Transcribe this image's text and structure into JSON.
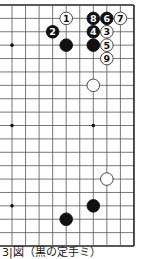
{
  "diagram": {
    "type": "go-board-partial",
    "grid": {
      "columns": 10,
      "rows": 19,
      "x0": 12,
      "dx": 13.55,
      "y0": 5,
      "dy": 13.39,
      "edges": {
        "top": true,
        "right": true,
        "bottom": true,
        "left": false
      },
      "line_color": "#555555",
      "edge_color": "#222222"
    },
    "star_points": [
      {
        "col": 0,
        "row": 3
      },
      {
        "col": 0,
        "row": 9
      },
      {
        "col": 0,
        "row": 15
      },
      {
        "col": 6,
        "row": 3
      },
      {
        "col": 6,
        "row": 9
      },
      {
        "col": 6,
        "row": 15
      }
    ],
    "stones": [
      {
        "color": "white",
        "col": 4,
        "row": 1,
        "label": "1"
      },
      {
        "color": "black",
        "col": 3,
        "row": 2,
        "label": "2"
      },
      {
        "color": "white",
        "col": 7,
        "row": 2,
        "label": "3"
      },
      {
        "color": "black",
        "col": 6,
        "row": 2,
        "label": "4"
      },
      {
        "color": "white",
        "col": 7,
        "row": 3,
        "label": "5"
      },
      {
        "color": "black",
        "col": 7,
        "row": 1,
        "label": "6"
      },
      {
        "color": "white",
        "col": 8,
        "row": 1,
        "label": "7"
      },
      {
        "color": "black",
        "col": 6,
        "row": 1,
        "label": "8"
      },
      {
        "color": "white",
        "col": 7,
        "row": 4,
        "label": "9"
      },
      {
        "color": "black",
        "col": 4,
        "row": 3,
        "label": ""
      },
      {
        "color": "black",
        "col": 6,
        "row": 3,
        "label": ""
      },
      {
        "color": "white",
        "col": 6,
        "row": 6,
        "label": ""
      },
      {
        "color": "white",
        "col": 7,
        "row": 13,
        "label": ""
      },
      {
        "color": "black",
        "col": 6,
        "row": 15,
        "label": ""
      },
      {
        "color": "black",
        "col": 4,
        "row": 16,
        "label": ""
      }
    ]
  },
  "caption": "3|図（黒の定手ミ）"
}
